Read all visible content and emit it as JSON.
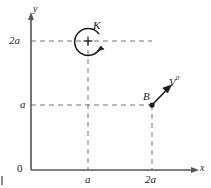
{
  "figure": {
    "type": "mechanics-free-body-diagram",
    "axes": {
      "x_label": "x",
      "y_label": "y",
      "origin_label": "0",
      "x_ticks": [
        {
          "label": "a",
          "value": "a"
        },
        {
          "label": "2a",
          "value": "2a"
        }
      ],
      "y_ticks": [
        {
          "label": "a",
          "value": "a"
        },
        {
          "label": "2a",
          "value": "2a"
        }
      ]
    },
    "elements": [
      {
        "name": "couple",
        "label": "K",
        "symbol": "+",
        "position": {
          "x": "a",
          "y": "2a"
        },
        "sense": "clockwise"
      },
      {
        "name": "point-b",
        "label": "B",
        "position": {
          "x": "2a",
          "y": "a"
        }
      },
      {
        "name": "force-vector",
        "label": "V",
        "sublabel": "0",
        "applied_at": "B",
        "direction": "up-right"
      }
    ],
    "colors": {
      "line": "#4a4a4a",
      "dash": "#6b6b6b",
      "ink": "#1a1a1a"
    }
  }
}
